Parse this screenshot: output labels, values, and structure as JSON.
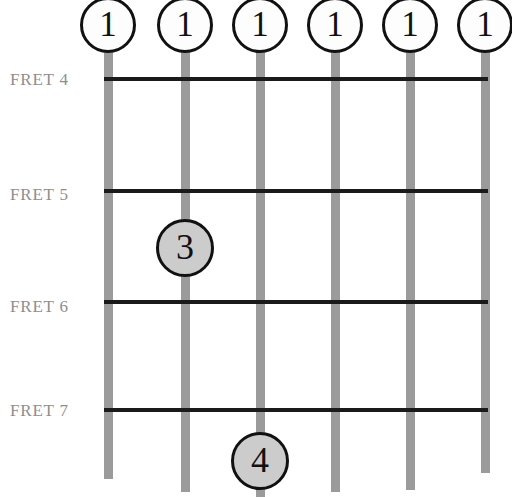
{
  "diagram": {
    "type": "guitar-chord-diagram",
    "width": 512,
    "height": 497,
    "background_color": "#ffffff",
    "string_color": "#9b9b9b",
    "fret_line_color": "#1a1a1a",
    "label_color": "#8e8e8e",
    "open_marker_fill": "#fdfdfd",
    "finger_marker_fill": "#cccccc",
    "marker_border_color": "#111111"
  },
  "fret_labels": [
    {
      "text": "FRET 4",
      "x": 10,
      "y": 70
    },
    {
      "text": "FRET 5",
      "x": 10,
      "y": 185
    },
    {
      "text": "FRET 6",
      "x": 10,
      "y": 297
    },
    {
      "text": "FRET 7",
      "x": 10,
      "y": 401
    }
  ],
  "fret_lines": [
    {
      "name": "fret-4",
      "y": 77,
      "x": 104,
      "width": 384
    },
    {
      "name": "fret-5",
      "y": 189,
      "x": 104,
      "width": 384
    },
    {
      "name": "fret-6",
      "y": 300,
      "x": 104,
      "width": 384
    },
    {
      "name": "fret-7",
      "y": 408,
      "x": 104,
      "width": 384
    }
  ],
  "strings": [
    {
      "name": "string-1",
      "x": 104,
      "bottom_y": 479
    },
    {
      "name": "string-2",
      "x": 181,
      "bottom_y": 492
    },
    {
      "name": "string-3",
      "x": 256,
      "bottom_y": 497
    },
    {
      "name": "string-4",
      "x": 331,
      "bottom_y": 492
    },
    {
      "name": "string-5",
      "x": 406,
      "bottom_y": 490
    },
    {
      "name": "string-6",
      "x": 481,
      "bottom_y": 473
    }
  ],
  "markers": [
    {
      "name": "open-marker-string-1",
      "label": "1",
      "kind": "open",
      "cx": 108,
      "cy": 25
    },
    {
      "name": "open-marker-string-2",
      "label": "1",
      "kind": "open",
      "cx": 185,
      "cy": 25
    },
    {
      "name": "open-marker-string-3",
      "label": "1",
      "kind": "open",
      "cx": 260,
      "cy": 25
    },
    {
      "name": "open-marker-string-4",
      "label": "1",
      "kind": "open",
      "cx": 335,
      "cy": 25
    },
    {
      "name": "open-marker-string-5",
      "label": "1",
      "kind": "open",
      "cx": 410,
      "cy": 25
    },
    {
      "name": "open-marker-string-6",
      "label": "1",
      "kind": "open",
      "cx": 485,
      "cy": 25
    },
    {
      "name": "finger-marker-3",
      "label": "3",
      "kind": "finger",
      "cx": 185,
      "cy": 248
    },
    {
      "name": "finger-marker-4",
      "label": "4",
      "kind": "finger",
      "cx": 260,
      "cy": 461
    }
  ]
}
